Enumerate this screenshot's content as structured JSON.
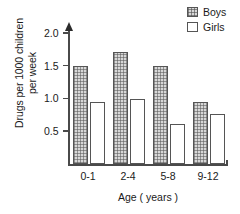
{
  "chart_data": {
    "type": "bar",
    "title": "",
    "categories": [
      "0-1",
      "2-4",
      "5-8",
      "9-12"
    ],
    "series": [
      {
        "name": "Boys",
        "values": [
          1.5,
          1.72,
          1.5,
          0.95
        ],
        "fill": "stippled",
        "color": "#d8d8d8"
      },
      {
        "name": "Girls",
        "values": [
          0.95,
          1.0,
          0.61,
          0.77
        ],
        "fill": "empty",
        "color": "#ffffff"
      }
    ],
    "xlabel": "Age ( years )",
    "ylabel": "Drugs per 1000 children per week",
    "ylabel_line1": "Drugs per 1000 children",
    "ylabel_line2": "per week",
    "ylim": [
      0,
      2.2
    ],
    "yticks": [
      0.5,
      1.0,
      1.5,
      2.0
    ],
    "ytick_labels": [
      "0.5",
      "1.0",
      "1.5",
      "2.0"
    ],
    "grid": false,
    "legend_position": "top-right",
    "legend": [
      "Boys",
      "Girls"
    ]
  },
  "axes": {
    "y_title_line1": "Drugs per 1000 children",
    "y_title_line2": "per week",
    "x_title": "Age ( years )",
    "y_tick_labels": [
      "2.0",
      "1.5",
      "1.0",
      "0.5"
    ],
    "x_category_labels": [
      "0-1",
      "2-4",
      "5-8",
      "9-12"
    ]
  },
  "legend": {
    "items": [
      {
        "label": "Boys"
      },
      {
        "label": "Girls"
      }
    ]
  }
}
